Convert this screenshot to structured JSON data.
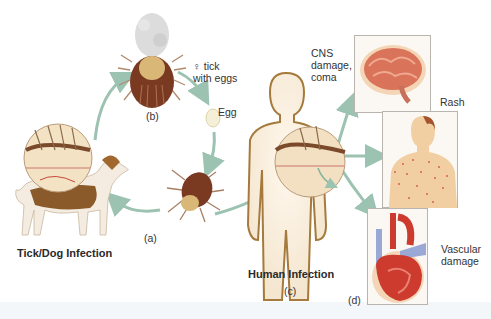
{
  "figure": {
    "panels": {
      "a": "(a)",
      "b": "(b)",
      "c": "(c)",
      "d": "(d)"
    },
    "labels": {
      "female_tick_symbol": "♀",
      "female_tick_line1": "tick",
      "female_tick_line2": "with eggs",
      "egg": "Egg",
      "tick_dog_infection": "Tick/Dog Infection",
      "human_infection": "Human Infection",
      "cns_line1": "CNS",
      "cns_line2": "damage,",
      "cns_line3": "coma",
      "rash": "Rash",
      "vascular_line1": "Vascular",
      "vascular_line2": "damage"
    },
    "colors": {
      "arrow": "#9cc3b2",
      "tick_body": "#7a3a22",
      "tick_scutum": "#d9b877",
      "skin": "#f2d3ad",
      "outline": "#a57a3c",
      "brain": "#d9735a",
      "heart": "#cc3b2e",
      "vessel_blue": "#9aa8d6",
      "rash_dot": "#d9624a",
      "dog_brown": "#8b5a2b",
      "dog_white": "#f4ece0"
    }
  }
}
